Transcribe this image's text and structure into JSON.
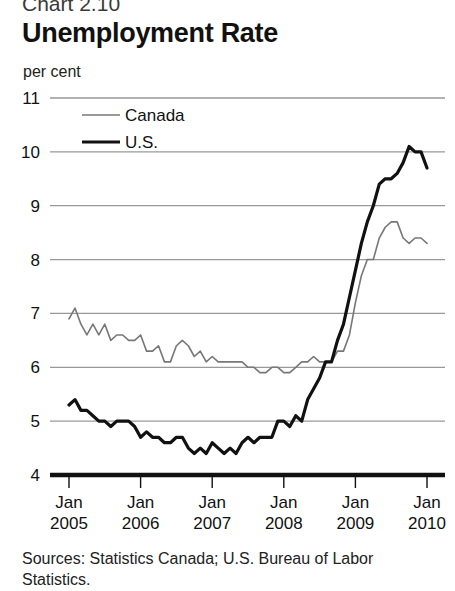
{
  "header": {
    "chart_number": "Chart 2.10",
    "title": "Unemployment Rate",
    "unit_label": "per cent"
  },
  "sources": {
    "text": "Sources: Statistics Canada; U.S. Bureau of Labor Statistics."
  },
  "colors": {
    "canada_line": "#777777",
    "us_line": "#111111",
    "gridline": "#999999",
    "axis": "#111111",
    "background": "#ffffff"
  },
  "chart_data": {
    "type": "line",
    "title": "Unemployment Rate",
    "subtitle": "Chart 2.10",
    "xlabel": "",
    "ylabel": "per cent",
    "ylim": [
      4,
      11
    ],
    "yticks": [
      4,
      5,
      6,
      7,
      8,
      9,
      10,
      11
    ],
    "ytick_labels": [
      "4",
      "5",
      "6",
      "7",
      "8",
      "9",
      "10",
      "11"
    ],
    "xlim": [
      "2005-01",
      "2010-01"
    ],
    "xticks": [
      "2005-01",
      "2006-01",
      "2007-01",
      "2008-01",
      "2009-01",
      "2010-01"
    ],
    "xtick_labels": [
      {
        "line1": "Jan",
        "line2": "2005"
      },
      {
        "line1": "Jan",
        "line2": "2006"
      },
      {
        "line1": "Jan",
        "line2": "2007"
      },
      {
        "line1": "Jan",
        "line2": "2008"
      },
      {
        "line1": "Jan",
        "line2": "2009"
      },
      {
        "line1": "Jan",
        "line2": "2010"
      }
    ],
    "grid": true,
    "grid_axis": "y",
    "legend_position": "top-left-inside",
    "legend": [
      "Canada",
      "U.S."
    ],
    "series": [
      {
        "name": "Canada",
        "color": "#777777",
        "linewidth": 1.6,
        "x": [
          "2005-01",
          "2005-02",
          "2005-03",
          "2005-04",
          "2005-05",
          "2005-06",
          "2005-07",
          "2005-08",
          "2005-09",
          "2005-10",
          "2005-11",
          "2005-12",
          "2006-01",
          "2006-02",
          "2006-03",
          "2006-04",
          "2006-05",
          "2006-06",
          "2006-07",
          "2006-08",
          "2006-09",
          "2006-10",
          "2006-11",
          "2006-12",
          "2007-01",
          "2007-02",
          "2007-03",
          "2007-04",
          "2007-05",
          "2007-06",
          "2007-07",
          "2007-08",
          "2007-09",
          "2007-10",
          "2007-11",
          "2007-12",
          "2008-01",
          "2008-02",
          "2008-03",
          "2008-04",
          "2008-05",
          "2008-06",
          "2008-07",
          "2008-08",
          "2008-09",
          "2008-10",
          "2008-11",
          "2008-12",
          "2009-01",
          "2009-02",
          "2009-03",
          "2009-04",
          "2009-05",
          "2009-06",
          "2009-07",
          "2009-08",
          "2009-09",
          "2009-10",
          "2009-11",
          "2009-12",
          "2010-01"
        ],
        "values": [
          6.9,
          7.1,
          6.8,
          6.6,
          6.8,
          6.6,
          6.8,
          6.5,
          6.6,
          6.6,
          6.5,
          6.5,
          6.6,
          6.3,
          6.3,
          6.4,
          6.1,
          6.1,
          6.4,
          6.5,
          6.4,
          6.2,
          6.3,
          6.1,
          6.2,
          6.1,
          6.1,
          6.1,
          6.1,
          6.1,
          6.0,
          6.0,
          5.9,
          5.9,
          6.0,
          6.0,
          5.9,
          5.9,
          6.0,
          6.1,
          6.1,
          6.2,
          6.1,
          6.1,
          6.1,
          6.3,
          6.3,
          6.6,
          7.2,
          7.7,
          8.0,
          8.0,
          8.4,
          8.6,
          8.7,
          8.7,
          8.4,
          8.3,
          8.4,
          8.4,
          8.3
        ]
      },
      {
        "name": "U.S.",
        "color": "#111111",
        "linewidth": 3.2,
        "x": [
          "2005-01",
          "2005-02",
          "2005-03",
          "2005-04",
          "2005-05",
          "2005-06",
          "2005-07",
          "2005-08",
          "2005-09",
          "2005-10",
          "2005-11",
          "2005-12",
          "2006-01",
          "2006-02",
          "2006-03",
          "2006-04",
          "2006-05",
          "2006-06",
          "2006-07",
          "2006-08",
          "2006-09",
          "2006-10",
          "2006-11",
          "2006-12",
          "2007-01",
          "2007-02",
          "2007-03",
          "2007-04",
          "2007-05",
          "2007-06",
          "2007-07",
          "2007-08",
          "2007-09",
          "2007-10",
          "2007-11",
          "2007-12",
          "2008-01",
          "2008-02",
          "2008-03",
          "2008-04",
          "2008-05",
          "2008-06",
          "2008-07",
          "2008-08",
          "2008-09",
          "2008-10",
          "2008-11",
          "2008-12",
          "2009-01",
          "2009-02",
          "2009-03",
          "2009-04",
          "2009-05",
          "2009-06",
          "2009-07",
          "2009-08",
          "2009-09",
          "2009-10",
          "2009-11",
          "2009-12",
          "2010-01"
        ],
        "values": [
          5.3,
          5.4,
          5.2,
          5.2,
          5.1,
          5.0,
          5.0,
          4.9,
          5.0,
          5.0,
          5.0,
          4.9,
          4.7,
          4.8,
          4.7,
          4.7,
          4.6,
          4.6,
          4.7,
          4.7,
          4.5,
          4.4,
          4.5,
          4.4,
          4.6,
          4.5,
          4.4,
          4.5,
          4.4,
          4.6,
          4.7,
          4.6,
          4.7,
          4.7,
          4.7,
          5.0,
          5.0,
          4.9,
          5.1,
          5.0,
          5.4,
          5.6,
          5.8,
          6.1,
          6.1,
          6.5,
          6.8,
          7.3,
          7.8,
          8.3,
          8.7,
          9.0,
          9.4,
          9.5,
          9.5,
          9.6,
          9.8,
          10.1,
          10.0,
          10.0,
          9.7
        ]
      }
    ]
  }
}
